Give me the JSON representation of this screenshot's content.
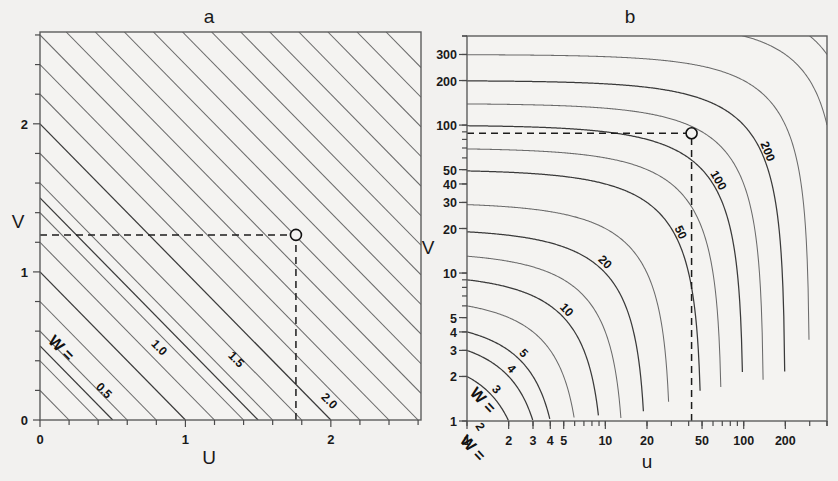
{
  "figure": {
    "background_color": "#f2f1ef",
    "panel_background": "#f4f3f1",
    "contour_color": "#6b6b6b",
    "axis_color": "#5d5d5d",
    "dash_color": "#1c1c1c",
    "marker_label": "open-circle-marker"
  },
  "panels": [
    {
      "id": "a",
      "label": "a",
      "xlabel": "U",
      "ylabel": "V",
      "contour_prefix": "W =",
      "chart_ref": 0
    },
    {
      "id": "b",
      "label": "b",
      "xlabel": "u",
      "ylabel": "V",
      "contour_prefix": "W =",
      "chart_ref": 1
    }
  ],
  "chart_data": [
    {
      "type": "line",
      "subtype": "contour-nomogram",
      "panel": "a",
      "title": "a",
      "xlabel": "U",
      "ylabel": "V",
      "xscale": "linear",
      "yscale": "linear",
      "xlim": [
        0,
        2.62
      ],
      "ylim": [
        0,
        2.62
      ],
      "grid": false,
      "legend": "none",
      "xticks_major": [
        0,
        1,
        2
      ],
      "xticklabels": [
        "0",
        "1",
        "2"
      ],
      "xticks_minor": [
        0.2,
        0.4,
        0.6,
        0.8,
        1.2,
        1.4,
        1.6,
        1.8,
        2.2,
        2.4,
        2.6
      ],
      "yticks_major": [
        0,
        1,
        2
      ],
      "yticklabels": [
        "0",
        "1",
        "2"
      ],
      "yticks_minor": [
        0.2,
        0.4,
        0.6,
        0.8,
        1.2,
        1.4,
        1.6,
        1.8,
        2.2,
        2.4,
        2.6
      ],
      "relation": "W = U + V",
      "contours": [
        {
          "value": 0.2,
          "label": "",
          "labelled": false
        },
        {
          "value": 0.4,
          "label": "",
          "labelled": false
        },
        {
          "value": 0.5,
          "label": "0.5",
          "labelled": true,
          "prefix": "W ="
        },
        {
          "value": 0.6,
          "label": "",
          "labelled": false
        },
        {
          "value": 0.8,
          "label": "",
          "labelled": false
        },
        {
          "value": 1.0,
          "label": "1.0",
          "labelled": true
        },
        {
          "value": 1.2,
          "label": "",
          "labelled": false
        },
        {
          "value": 1.4,
          "label": "",
          "labelled": false
        },
        {
          "value": 1.5,
          "label": "1.5",
          "labelled": true
        },
        {
          "value": 1.6,
          "label": "",
          "labelled": false
        },
        {
          "value": 1.8,
          "label": "",
          "labelled": false
        },
        {
          "value": 2.0,
          "label": "2.0",
          "labelled": true
        },
        {
          "value": 2.2,
          "label": "",
          "labelled": false
        },
        {
          "value": 2.4,
          "label": "",
          "labelled": false
        },
        {
          "value": 2.6,
          "label": "",
          "labelled": false
        },
        {
          "value": 2.8,
          "label": "",
          "labelled": false
        },
        {
          "value": 3.0,
          "label": "",
          "labelled": false
        },
        {
          "value": 3.2,
          "label": "",
          "labelled": false
        },
        {
          "value": 3.4,
          "label": "",
          "labelled": false
        },
        {
          "value": 3.6,
          "label": "",
          "labelled": false
        },
        {
          "value": 3.8,
          "label": "",
          "labelled": false
        },
        {
          "value": 4.0,
          "label": "",
          "labelled": false
        },
        {
          "value": 4.2,
          "label": "",
          "labelled": false
        },
        {
          "value": 4.4,
          "label": "",
          "labelled": false
        },
        {
          "value": 4.6,
          "label": "",
          "labelled": false
        },
        {
          "value": 4.8,
          "label": "",
          "labelled": false
        },
        {
          "value": 5.0,
          "label": "",
          "labelled": false
        }
      ],
      "marker": {
        "x": 1.76,
        "y": 1.25,
        "style": "open-circle"
      },
      "guides": [
        {
          "orientation": "horizontal",
          "value": 1.25,
          "from_x": 0,
          "to_x": 1.76,
          "style": "dashed"
        },
        {
          "orientation": "vertical",
          "value": 1.76,
          "from_y": 0,
          "to_y": 1.25,
          "style": "dashed"
        }
      ]
    },
    {
      "type": "line",
      "subtype": "contour-nomogram",
      "panel": "b",
      "title": "b",
      "xlabel": "u",
      "ylabel": "V",
      "xscale": "log",
      "yscale": "log",
      "xlim": [
        1,
        400
      ],
      "ylim": [
        1,
        400
      ],
      "grid": false,
      "legend": "none",
      "xticks_major": [
        1,
        2,
        3,
        4,
        5,
        10,
        20,
        50,
        100,
        200
      ],
      "xticklabels": [
        "1",
        "2",
        "3",
        "4",
        "5",
        "10",
        "20",
        "50",
        "100",
        "200"
      ],
      "yticks_major": [
        1,
        2,
        3,
        4,
        5,
        10,
        20,
        30,
        40,
        50,
        100,
        200,
        300
      ],
      "yticklabels": [
        "1",
        "2",
        "3",
        "4",
        "5",
        "10",
        "20",
        "30",
        "40",
        "50",
        "100",
        "200",
        "300"
      ],
      "relation": "W = u + v",
      "contours": [
        {
          "value": 2,
          "label": "2",
          "labelled": true,
          "prefix": "W ="
        },
        {
          "value": 3,
          "label": "3",
          "labelled": true
        },
        {
          "value": 4,
          "label": "4",
          "labelled": true
        },
        {
          "value": 5,
          "label": "5",
          "labelled": true
        },
        {
          "value": 7,
          "label": "",
          "labelled": false
        },
        {
          "value": 10,
          "label": "10",
          "labelled": true
        },
        {
          "value": 14,
          "label": "",
          "labelled": false
        },
        {
          "value": 20,
          "label": "20",
          "labelled": true
        },
        {
          "value": 30,
          "label": "",
          "labelled": false
        },
        {
          "value": 50,
          "label": "50",
          "labelled": true
        },
        {
          "value": 70,
          "label": "",
          "labelled": false
        },
        {
          "value": 100,
          "label": "100",
          "labelled": true
        },
        {
          "value": 140,
          "label": "",
          "labelled": false
        },
        {
          "value": 200,
          "label": "200",
          "labelled": true
        },
        {
          "value": 300,
          "label": "",
          "labelled": false
        },
        {
          "value": 500,
          "label": "",
          "labelled": false
        },
        {
          "value": 700,
          "label": "",
          "labelled": false
        }
      ],
      "marker": {
        "x": 42,
        "y": 88,
        "style": "open-circle"
      },
      "guides": [
        {
          "orientation": "horizontal",
          "value": 88,
          "from_x": 1,
          "to_x": 42,
          "style": "dashed"
        },
        {
          "orientation": "vertical",
          "value": 42,
          "from_y": 1,
          "to_y": 88,
          "style": "dashed"
        }
      ]
    }
  ]
}
